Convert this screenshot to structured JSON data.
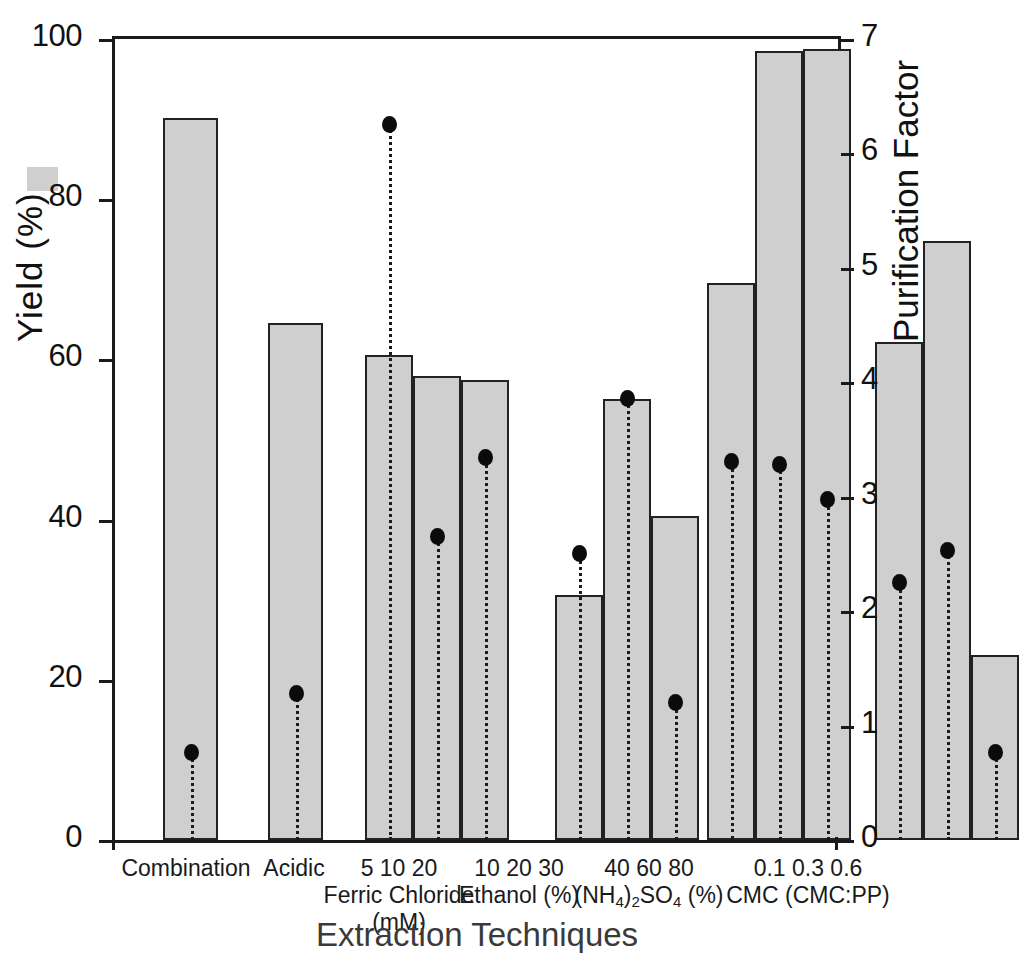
{
  "chart_data": {
    "type": "bar",
    "title": "",
    "xlabel": "Extraction Techniques",
    "ylabel": "Yield (%)",
    "y2label": "Purification Factor",
    "ylim": [
      0,
      100
    ],
    "y2lim": [
      0,
      7
    ],
    "grid": false,
    "legend_position": "inline-axis",
    "yticks": [
      "0",
      "20",
      "40",
      "60",
      "80",
      "100"
    ],
    "y2ticks": [
      "0",
      "1",
      "2",
      "3",
      "4",
      "5",
      "6",
      "7"
    ],
    "legend": [
      {
        "name": "yield-swatch",
        "label": "",
        "marker": "filled-rectangle",
        "color": "#cfcfcf"
      },
      {
        "name": "purification-dot",
        "label": "",
        "marker": "filled-circle",
        "color": "#0b0b0b"
      }
    ],
    "groups": [
      {
        "name": "Combination",
        "levels": "",
        "unit": "",
        "categories": [
          "Combination"
        ],
        "yield": [
          90.2
        ],
        "purification_factor": [
          0.76
        ]
      },
      {
        "name": "Acidic",
        "levels": "",
        "unit": "",
        "categories": [
          "Acidic"
        ],
        "yield": [
          64.5
        ],
        "purification_factor": [
          1.28
        ]
      },
      {
        "name": "Ferric Chloride",
        "levels": "5   10   20",
        "unit": "(mM)",
        "categories": [
          "5",
          "10",
          "20"
        ],
        "yield": [
          60.6,
          57.9,
          57.4
        ],
        "purification_factor": [
          6.25,
          2.65,
          3.34
        ]
      },
      {
        "name": "Ethanol (%)",
        "levels": "10 20 30",
        "unit": "",
        "categories": [
          "10",
          "20",
          "30"
        ],
        "yield": [
          30.6,
          55.0,
          40.4
        ],
        "purification_factor": [
          2.5,
          3.85,
          1.2
        ]
      },
      {
        "name": "(NH4)2SO4 (%)",
        "levels": "40 60 80",
        "unit": "",
        "categories": [
          "40",
          "60",
          "80"
        ],
        "yield": [
          69.5,
          98.5,
          98.7
        ],
        "purification_factor": [
          3.3,
          3.28,
          2.97
        ]
      },
      {
        "name": "CMC (CMC:PP)",
        "levels": "0.1 0.3 0.6",
        "unit": "",
        "categories": [
          "0.1",
          "0.3",
          "0.6"
        ],
        "yield": [
          62.2,
          74.8,
          23.1
        ],
        "purification_factor": [
          2.25,
          2.53,
          0.76
        ]
      }
    ]
  },
  "axes": {
    "y_left_title": "Yield (%)",
    "y_right_title": "Purification Factor",
    "x_title": "Extraction Techniques",
    "y_left_ticks": [
      "100",
      "80",
      "60",
      "40",
      "20",
      "0"
    ],
    "y_right_ticks": [
      "7",
      "6",
      "5",
      "4",
      "3",
      "2",
      "1",
      "0"
    ]
  },
  "x_groups": [
    {
      "levels": "",
      "name": "Combination",
      "unit": ""
    },
    {
      "levels": "",
      "name": "Acidic",
      "unit": ""
    },
    {
      "levels": "5    10    20",
      "name": "Ferric Chloride",
      "unit": "(mM)"
    },
    {
      "levels": "10 20 30",
      "name": "Ethanol (%)",
      "unit": ""
    },
    {
      "levels": "40 60 80",
      "name": "(NH4)2SO4 (%)",
      "unit": ""
    },
    {
      "levels": "0.1 0.3 0.6",
      "name": "CMC (CMC:PP)",
      "unit": ""
    }
  ],
  "colors": {
    "bar_fill": "#cfcfcf",
    "bar_edge": "#222222",
    "marker": "#0b0b0b",
    "axis": "#1a1a1a",
    "background": "#ffffff"
  }
}
